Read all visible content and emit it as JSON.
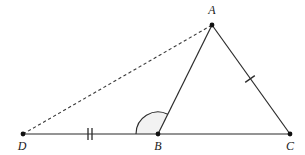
{
  "figure": {
    "background_color": "#ffffff",
    "stroke_color": "#2b2b2b",
    "dash_color": "#3a3a3a",
    "arc_fill_color": "#f2f2f2",
    "label_color": "#1a1a1a"
  },
  "points": {
    "A": {
      "label": "A",
      "x": 212,
      "y": 25,
      "label_x": 212,
      "label_y": 11
    },
    "B": {
      "label": "B",
      "x": 158,
      "y": 134,
      "label_x": 158,
      "label_y": 147
    },
    "C": {
      "label": "C",
      "x": 290,
      "y": 134,
      "label_x": 290,
      "label_y": 147
    },
    "D": {
      "label": "D",
      "x": 23,
      "y": 134,
      "label_x": 22,
      "label_y": 147
    }
  },
  "segments": {
    "base_DC": {
      "name": "D to C baseline",
      "from": "D",
      "to": "C",
      "style": "solid"
    },
    "AB": {
      "name": "A to B",
      "from": "A",
      "to": "B",
      "style": "solid"
    },
    "AC": {
      "name": "A to C",
      "from": "A",
      "to": "C",
      "style": "solid"
    },
    "DA": {
      "name": "D to A construction line",
      "from": "D",
      "to": "A",
      "style": "dashed"
    }
  },
  "tick_marks": {
    "DB_double": {
      "name": "double tick on segment DB",
      "x": 90,
      "y": 134,
      "count": 2
    },
    "AC_single": {
      "name": "single tick on segment AC",
      "x": 250,
      "y": 79,
      "count": 1
    }
  },
  "angle_arc": {
    "name": "angle DBA at vertex B",
    "vertex": "B",
    "radius": 22,
    "start_deg": 180,
    "end_deg": 63.6,
    "filled": true
  }
}
